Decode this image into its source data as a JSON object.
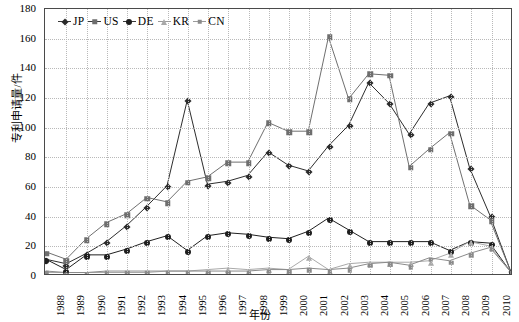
{
  "chart_data": {
    "type": "line",
    "title": "",
    "xlabel": "年份",
    "ylabel": "专利申请量/件",
    "ylim": [
      0,
      180
    ],
    "ytick_step": 20,
    "yticks": [
      180,
      160,
      140,
      120,
      100,
      80,
      60,
      40,
      20,
      0
    ],
    "grid": true,
    "legend_position": "top-left-inside",
    "categories": [
      "1988",
      "1989",
      "1990",
      "1991",
      "1992",
      "1993",
      "1994",
      "1995",
      "1996",
      "1997",
      "1998",
      "1999",
      "2000",
      "2001",
      "2002",
      "2003",
      "2004",
      "2005",
      "2006",
      "2007",
      "2008",
      "2009",
      "2010",
      "2011"
    ],
    "series": [
      {
        "name": "JP",
        "marker": "diamond",
        "color": "#2b2b2b",
        "values": [
          10,
          7,
          14,
          22,
          33,
          46,
          60,
          118,
          61,
          63,
          67,
          83,
          74,
          70,
          87,
          101,
          130,
          116,
          95,
          116,
          121,
          72,
          40,
          3
        ]
      },
      {
        "name": "US",
        "marker": "square",
        "color": "#6e6e6e",
        "values": [
          15,
          10,
          24,
          35,
          41,
          52,
          49,
          63,
          66,
          76,
          76,
          103,
          97,
          97,
          161,
          119,
          136,
          135,
          73,
          85,
          96,
          47,
          37,
          3
        ]
      },
      {
        "name": "DE",
        "marker": "circle",
        "color": "#1e1e1e",
        "values": [
          10,
          3,
          13,
          13,
          17,
          22,
          26,
          16,
          26,
          28,
          27,
          25,
          24,
          29,
          38,
          30,
          22,
          22,
          22,
          22,
          16,
          22,
          21,
          2
        ]
      },
      {
        "name": "KR",
        "marker": "triangle",
        "color": "#a8a8a8",
        "values": [
          1,
          1,
          1,
          1,
          1,
          1,
          2,
          2,
          3,
          4,
          3,
          4,
          3,
          12,
          3,
          7,
          8,
          8,
          8,
          9,
          14,
          22,
          19,
          2
        ]
      },
      {
        "name": "CN",
        "marker": "small-square",
        "color": "#8a8a8a",
        "values": [
          2,
          1,
          1,
          2,
          2,
          2,
          2,
          2,
          2,
          2,
          2,
          3,
          3,
          4,
          3,
          4,
          7,
          8,
          6,
          11,
          9,
          14,
          18,
          2
        ]
      }
    ]
  },
  "legend": {
    "items": [
      {
        "label": "JP",
        "marker": "diamond"
      },
      {
        "label": "US",
        "marker": "square"
      },
      {
        "label": "DE",
        "marker": "circle"
      },
      {
        "label": "KR",
        "marker": "triangle"
      },
      {
        "label": "CN",
        "marker": "small-square"
      }
    ]
  },
  "axes": {
    "y_title": "专利申请量/件",
    "x_title": "年份"
  }
}
